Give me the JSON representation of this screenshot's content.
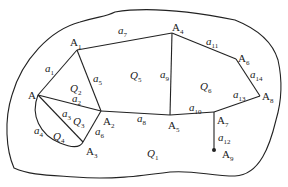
{
  "diagram": {
    "type": "planar-graph-regions",
    "vertices": [
      {
        "id": "A",
        "label": "A",
        "sub": "",
        "x": 38,
        "y": 95,
        "lx": 28,
        "ly": 99
      },
      {
        "id": "A1",
        "label": "A",
        "sub": "1",
        "x": 77,
        "y": 50,
        "lx": 70,
        "ly": 46
      },
      {
        "id": "A2",
        "label": "A",
        "sub": "2",
        "x": 101,
        "y": 111,
        "lx": 103,
        "ly": 125
      },
      {
        "id": "A3",
        "label": "A",
        "sub": "3",
        "x": 83,
        "y": 142,
        "lx": 86,
        "ly": 155
      },
      {
        "id": "A4",
        "label": "A",
        "sub": "4",
        "x": 172,
        "y": 33,
        "lx": 172,
        "ly": 31
      },
      {
        "id": "A5",
        "label": "A",
        "sub": "5",
        "x": 170,
        "y": 115,
        "lx": 168,
        "ly": 129
      },
      {
        "id": "A6",
        "label": "A",
        "sub": "6",
        "x": 236,
        "y": 59,
        "lx": 238,
        "ly": 62
      },
      {
        "id": "A7",
        "label": "A",
        "sub": "7",
        "x": 214,
        "y": 112,
        "lx": 217,
        "ly": 124
      },
      {
        "id": "A8",
        "label": "A",
        "sub": "8",
        "x": 260,
        "y": 96,
        "lx": 262,
        "ly": 100
      },
      {
        "id": "A9",
        "label": "A",
        "sub": "9",
        "x": 214,
        "y": 150,
        "lx": 222,
        "ly": 158
      }
    ],
    "edges": [
      {
        "label": "a",
        "sub": "1",
        "from": "A",
        "to": "A1",
        "lx": 45,
        "ly": 72
      },
      {
        "label": "a",
        "sub": "2",
        "from": "A",
        "to": "A2",
        "lx": 72,
        "ly": 102
      },
      {
        "label": "a",
        "sub": "3",
        "from": "A",
        "to": "A3",
        "lx": 62,
        "ly": 117
      },
      {
        "label": "a",
        "sub": "4",
        "from": "A",
        "to": "A3",
        "lx": 34,
        "ly": 134
      },
      {
        "label": "a",
        "sub": "5",
        "from": "A1",
        "to": "A2",
        "lx": 93,
        "ly": 82
      },
      {
        "label": "a",
        "sub": "6",
        "from": "A2",
        "to": "A3",
        "lx": 95,
        "ly": 135
      },
      {
        "label": "a",
        "sub": "7",
        "from": "A1",
        "to": "A4",
        "lx": 118,
        "ly": 34
      },
      {
        "label": "a",
        "sub": "8",
        "from": "A2",
        "to": "A5",
        "lx": 137,
        "ly": 122
      },
      {
        "label": "a",
        "sub": "9",
        "from": "A4",
        "to": "A5",
        "lx": 160,
        "ly": 78
      },
      {
        "label": "a",
        "sub": "10",
        "from": "A5",
        "to": "A7",
        "lx": 189,
        "ly": 111
      },
      {
        "label": "a",
        "sub": "11",
        "from": "A4",
        "to": "A6",
        "lx": 206,
        "ly": 45
      },
      {
        "label": "a",
        "sub": "12",
        "from": "A7",
        "to": "A9",
        "lx": 218,
        "ly": 141
      },
      {
        "label": "a",
        "sub": "13",
        "from": "A7",
        "to": "A8",
        "lx": 233,
        "ly": 98
      },
      {
        "label": "a",
        "sub": "14",
        "from": "A6",
        "to": "A8",
        "lx": 250,
        "ly": 78
      }
    ],
    "regions": [
      {
        "label": "Q",
        "sub": "1",
        "lx": 147,
        "ly": 157
      },
      {
        "label": "Q",
        "sub": "2",
        "lx": 70,
        "ly": 92
      },
      {
        "label": "Q",
        "sub": "3",
        "lx": 73,
        "ly": 125
      },
      {
        "label": "Q",
        "sub": "4",
        "lx": 53,
        "ly": 140
      },
      {
        "label": "Q",
        "sub": "5",
        "lx": 130,
        "ly": 79
      },
      {
        "label": "Q",
        "sub": "6",
        "lx": 200,
        "ly": 90
      }
    ]
  }
}
